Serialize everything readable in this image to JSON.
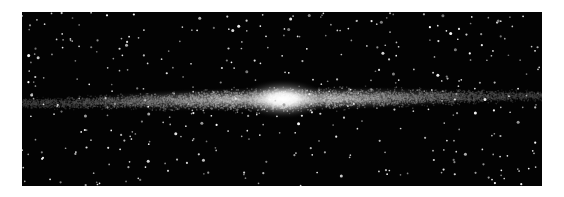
{
  "image": {
    "subject": "edge-on spiral galaxy with bright central bulge against star field",
    "background_color": "#ffffff",
    "sky_color": "#030303",
    "glow_color": "#ffffff"
  }
}
